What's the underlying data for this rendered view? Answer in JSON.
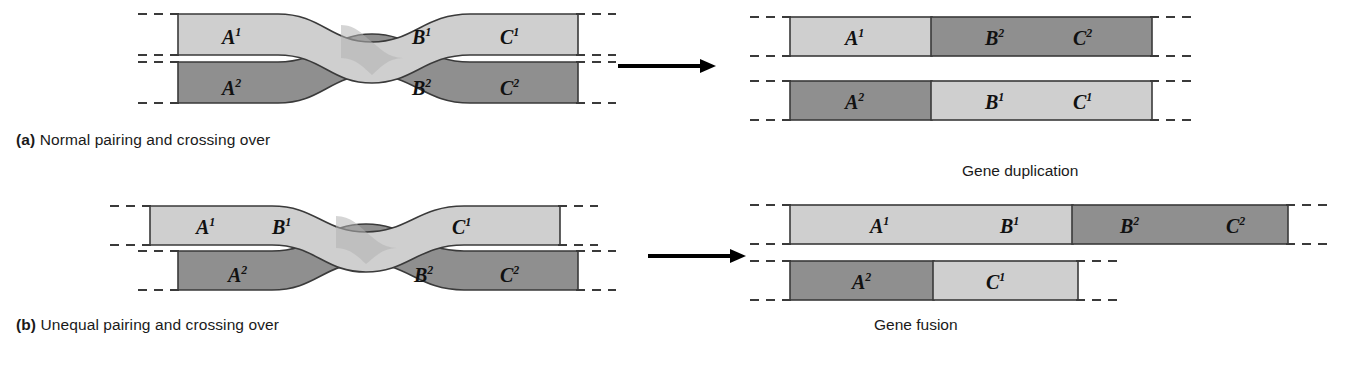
{
  "figure": {
    "type": "biology-diagram",
    "colors": {
      "light_chromatid": "#cfcfcf",
      "dark_chromatid": "#8f8f8f",
      "overlap_shade": "#b3b3b3",
      "outline": "#3a3a3a",
      "arrow": "#000000",
      "text": "#1a1a1a",
      "background": "#ffffff"
    }
  },
  "panels": {
    "a": {
      "letter": "(a)",
      "caption": "Normal pairing and crossing over",
      "left": {
        "top_strand": {
          "shade": "light",
          "labels": [
            "A¹",
            "B¹",
            "C¹"
          ]
        },
        "bottom_strand": {
          "shade": "dark",
          "labels": [
            "A²",
            "B²",
            "C²"
          ]
        }
      },
      "right": {
        "top_chromosome": {
          "segments": [
            {
              "label": "A¹",
              "shade": "light"
            },
            {
              "label": "B²",
              "shade": "dark"
            },
            {
              "label": "C²",
              "shade": "dark"
            }
          ]
        },
        "bottom_chromosome": {
          "segments": [
            {
              "label": "A²",
              "shade": "dark"
            },
            {
              "label": "B¹",
              "shade": "light"
            },
            {
              "label": "C¹",
              "shade": "light"
            }
          ]
        }
      }
    },
    "b": {
      "letter": "(b)",
      "caption": "Unequal pairing and crossing over",
      "left": {
        "top_strand": {
          "shade": "light",
          "labels": [
            "A¹",
            "B¹",
            "C¹"
          ]
        },
        "bottom_strand": {
          "shade": "dark",
          "labels": [
            "A²",
            "B²",
            "C²"
          ]
        }
      },
      "right": {
        "annotation_top": "Gene duplication",
        "annotation_bottom": "Gene fusion",
        "top_chromosome": {
          "segments": [
            {
              "label": "A¹",
              "shade": "light"
            },
            {
              "label": "B¹",
              "shade": "light"
            },
            {
              "label": "B²",
              "shade": "dark"
            },
            {
              "label": "C²",
              "shade": "dark"
            }
          ]
        },
        "bottom_chromosome": {
          "segments": [
            {
              "label": "A²",
              "shade": "dark"
            },
            {
              "label": "C¹",
              "shade": "light"
            }
          ]
        }
      }
    }
  },
  "arrows": [
    {
      "name": "arrow-panel-a",
      "direction": "right"
    },
    {
      "name": "arrow-panel-b",
      "direction": "right"
    }
  ],
  "gene_labels": {
    "a1": "A",
    "a1s": "1",
    "a2": "A",
    "a2s": "2",
    "b1": "B",
    "b1s": "1",
    "b2": "B",
    "b2s": "2",
    "c1": "C",
    "c1s": "1",
    "c2": "C",
    "c2s": "2"
  }
}
